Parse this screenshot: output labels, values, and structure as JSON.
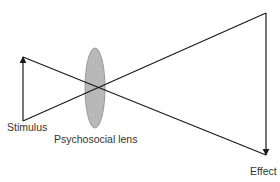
{
  "diagram": {
    "labels": {
      "stimulus": "Stimulus",
      "lens": "Psychosocial lens",
      "effect": "Effect"
    },
    "colors": {
      "line": "#1a1a1a",
      "lens_fill": "#b8b8b8",
      "lens_stroke": "#8a8a8a",
      "text": "#333333"
    }
  }
}
